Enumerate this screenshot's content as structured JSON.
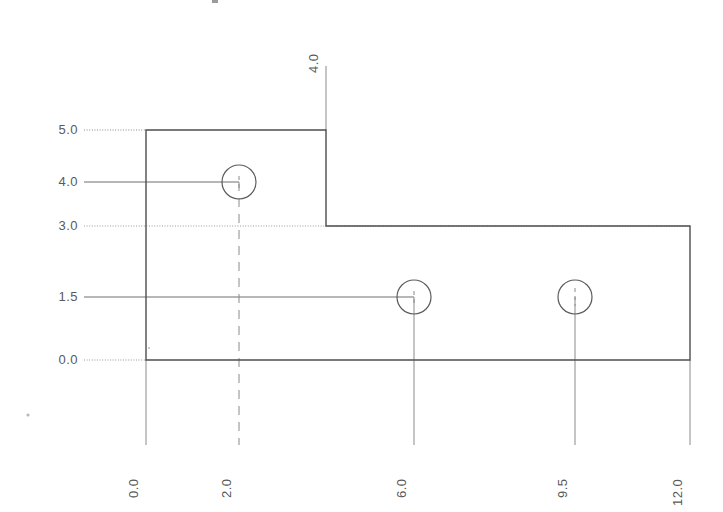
{
  "drawing": {
    "title": "",
    "type": "orthographic-part-outline",
    "units": "",
    "stroke_color": "#4d4d4d",
    "dimension_color": "#7a7a7a",
    "background_color": "#ffffff",
    "y_axis": {
      "label": "",
      "ticks": [
        {
          "value": "5.0",
          "px_y": 130,
          "line_style": "dotted",
          "line_end_px_x": 146
        },
        {
          "value": "4.0",
          "px_y": 182,
          "line_style": "solid",
          "line_end_px_x": 239
        },
        {
          "value": "3.0",
          "px_y": 226,
          "line_style": "dotted",
          "line_end_px_x": 690
        },
        {
          "value": "1.5",
          "px_y": 297,
          "line_style": "solid",
          "line_end_px_x": 414
        },
        {
          "value": "0.0",
          "px_y": 360,
          "line_style": "dotted",
          "line_end_px_x": 146
        }
      ]
    },
    "x_axis": {
      "label": "",
      "ticks": [
        {
          "value": "0.0",
          "px_x": 146
        },
        {
          "value": "2.0",
          "px_x": 239
        },
        {
          "value": "6.0",
          "px_x": 414
        },
        {
          "value": "9.5",
          "px_x": 575
        },
        {
          "value": "12.0",
          "px_x": 690
        }
      ]
    },
    "top_dimension": {
      "value": "4.0",
      "px_x": 326,
      "line_top_px_y": 66,
      "line_bottom_px_y": 130
    },
    "outline": {
      "name": "L-shaped-part-profile",
      "vertices_px": [
        [
          146,
          130
        ],
        [
          326,
          130
        ],
        [
          326,
          226
        ],
        [
          690,
          226
        ],
        [
          690,
          360
        ],
        [
          146,
          360
        ]
      ],
      "closed": true
    },
    "holes": [
      {
        "name": "hole-1",
        "x_value": "2.0",
        "y_value": "4.0",
        "px_cx": 239,
        "px_cy": 182,
        "px_r": 17
      },
      {
        "name": "hole-2",
        "x_value": "6.0",
        "y_value": "1.5",
        "px_cx": 414,
        "px_cy": 297,
        "px_r": 17
      },
      {
        "name": "hole-3",
        "x_value": "9.5",
        "y_value": "1.5",
        "px_cx": 575,
        "px_cy": 297,
        "px_r": 17
      }
    ],
    "extension_lines_bottom_px_y": 445,
    "artifacts": [
      {
        "name": "scan-speck-left",
        "px_x": 28,
        "px_y": 415
      },
      {
        "name": "scan-speck-top",
        "px_x": 214,
        "px_y": 2
      },
      {
        "name": "scan-speck-inner",
        "px_x": 149,
        "px_y": 348
      }
    ]
  }
}
